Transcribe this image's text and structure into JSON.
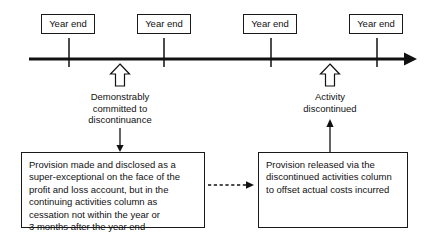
{
  "diagram": {
    "type": "timeline",
    "colors": {
      "line": "#111111",
      "box_border": "#1a1a1a",
      "box_fill": "#ffffff",
      "text": "#111111",
      "background": "#ffffff"
    },
    "axis": {
      "label": "time-axis",
      "direction": "left-to-right",
      "arrowhead": "right"
    },
    "tick_labels": [
      {
        "label": "Year end"
      },
      {
        "label": "Year end"
      },
      {
        "label": "Year end"
      },
      {
        "label": "Year end"
      }
    ],
    "event_markers": [
      {
        "icon": "hollow-up-arrow-icon",
        "lines": [
          "Demonstrably",
          "committed to",
          "discontinuance"
        ]
      },
      {
        "icon": "hollow-up-arrow-icon",
        "lines": [
          "Activity",
          "discontinued"
        ]
      }
    ],
    "notes": [
      {
        "name": "provision-made-note",
        "lines": [
          "Provision made and disclosed as a",
          "super-exceptional on the face of the",
          "profit and loss account, but in the",
          "continuing activities column as",
          "cessation not within the year or",
          "3 months after the year end"
        ]
      },
      {
        "name": "provision-released-note",
        "lines": [
          "Provision released via the",
          "discontinued activities column",
          "to offset actual costs incurred"
        ]
      }
    ],
    "connectors": [
      {
        "name": "down-arrow-to-provision-made",
        "style": "solid",
        "direction": "down"
      },
      {
        "name": "up-arrow-from-provision-released",
        "style": "solid",
        "direction": "up"
      },
      {
        "name": "dashed-link-between-notes",
        "style": "dashed",
        "direction": "right"
      }
    ]
  }
}
